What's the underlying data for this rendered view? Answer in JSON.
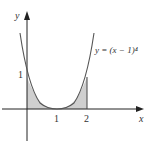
{
  "figure": {
    "equation_label": "y = (x − 1)⁴",
    "x_axis_label": "x",
    "y_axis_label": "y",
    "x_ticks": [
      "1",
      "2"
    ],
    "y_ticks": [
      "1"
    ],
    "shaded_region": "area between curve and x-axis from x=0 to x=2"
  },
  "colors": {
    "axis": "#222222",
    "curve": "#555555",
    "shade": "#cccccc"
  }
}
